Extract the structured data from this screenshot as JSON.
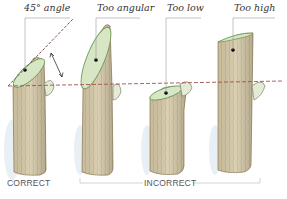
{
  "diagram": {
    "labels": {
      "correct_angle": "45° angle",
      "too_angular": "Too angular",
      "too_low": "Too low",
      "too_high": "Too high"
    },
    "captions": {
      "correct": "CORRECT",
      "incorrect": "INCORRECT"
    },
    "stems": [
      {
        "id": "correct",
        "label": "45° angle",
        "group": "CORRECT"
      },
      {
        "id": "too-angular",
        "label": "Too angular",
        "group": "INCORRECT"
      },
      {
        "id": "too-low",
        "label": "Too low",
        "group": "INCORRECT"
      },
      {
        "id": "too-high",
        "label": "Too high",
        "group": "INCORRECT"
      }
    ],
    "colors": {
      "bark": "#d8ccab",
      "bark_dark": "#8a7650",
      "cut_face": "#d7e6c4",
      "cut_rim": "#6f9a5a",
      "bud": "#e3ecd3",
      "reference_line": "#a0524a",
      "leader_line": "#9a9a9a",
      "shadow": "#d6e4ef"
    }
  }
}
